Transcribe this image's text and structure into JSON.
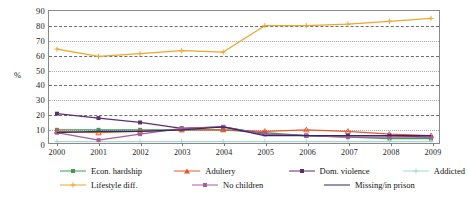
{
  "chart_data": {
    "type": "line",
    "title": "",
    "xlabel": "",
    "ylabel": "%",
    "ylim": [
      0,
      90
    ],
    "ytick_step": 10,
    "grid": true,
    "legend_position": "bottom",
    "categories": [
      "2000",
      "2001",
      "2002",
      "2003",
      "2004",
      "2005",
      "2006",
      "2007",
      "2008",
      "2009"
    ],
    "yticks": [
      "90",
      "80",
      "70",
      "60",
      "50",
      "40",
      "30",
      "20",
      "10",
      "0"
    ],
    "series": [
      {
        "name": "Econ. hardship",
        "color": "#3f9b53",
        "marker": "square",
        "values": [
          9,
          9,
          9,
          9,
          9,
          7,
          5,
          4,
          3,
          3
        ]
      },
      {
        "name": "Adultery",
        "color": "#e8562a",
        "marker": "triangle",
        "values": [
          8,
          7,
          8,
          9,
          9,
          8,
          9,
          8,
          6,
          5
        ]
      },
      {
        "name": "Dom. violence",
        "color": "#5b2d6e",
        "marker": "square",
        "values": [
          20,
          17,
          14,
          10,
          11,
          6,
          5,
          5,
          5,
          4
        ]
      },
      {
        "name": "Addicted",
        "color": "#a8d8d0",
        "marker": "plus",
        "values": [
          1,
          1,
          1,
          1,
          1,
          1,
          1,
          1,
          1,
          1
        ]
      },
      {
        "name": "Lifestyle diff.",
        "color": "#efa52e",
        "marker": "plus",
        "values": [
          64,
          59,
          61,
          63,
          62,
          80,
          80,
          81,
          83,
          85
        ]
      },
      {
        "name": "No children",
        "color": "#b05a9a",
        "marker": "square",
        "values": [
          7,
          2,
          6,
          10,
          11,
          6,
          5,
          4,
          4,
          4
        ]
      },
      {
        "name": "Missing/in prison",
        "color": "#2b2b6e",
        "marker": "none",
        "values": [
          7,
          8,
          8,
          9,
          11,
          5,
          5,
          5,
          5,
          5
        ]
      }
    ]
  },
  "legend": {
    "items": [
      {
        "label": "Econ. hardship"
      },
      {
        "label": "Adultery"
      },
      {
        "label": "Dom. violence"
      },
      {
        "label": "Addicted"
      },
      {
        "label": "Lifestyle diff."
      },
      {
        "label": "No children"
      },
      {
        "label": "Missing/in prison"
      }
    ]
  }
}
